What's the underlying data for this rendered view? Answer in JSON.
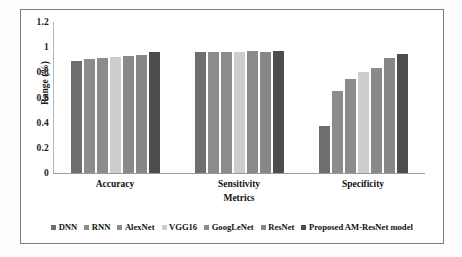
{
  "chart_data": {
    "type": "bar",
    "title": "",
    "xlabel": "Metrics",
    "ylabel": "Range (%)",
    "categories": [
      "Accuracy",
      "Sensitivity",
      "Specificity"
    ],
    "ylim": [
      0,
      1.2
    ],
    "yticks": [
      "0",
      "0.2",
      "0.4",
      "0.6",
      "0.8",
      "1",
      "1.2"
    ],
    "ytick_values": [
      0,
      0.2,
      0.4,
      0.6,
      0.8,
      1,
      1.2
    ],
    "grid": false,
    "legend_position": "bottom",
    "series": [
      {
        "name": "DNN",
        "color": "#6e6e6e",
        "values": [
          0.89,
          0.96,
          0.37
        ]
      },
      {
        "name": "RNN",
        "color": "#8c8c8c",
        "values": [
          0.91,
          0.965,
          0.65
        ]
      },
      {
        "name": "AlexNet",
        "color": "#8c8c8c",
        "values": [
          0.915,
          0.965,
          0.75
        ]
      },
      {
        "name": "VGG16",
        "color": "#cdcdcd",
        "values": [
          0.92,
          0.965,
          0.8
        ]
      },
      {
        "name": "GoogLeNet",
        "color": "#8a8a8a",
        "values": [
          0.93,
          0.97,
          0.835
        ]
      },
      {
        "name": "ResNet",
        "color": "#878787",
        "values": [
          0.94,
          0.965,
          0.915
        ]
      },
      {
        "name": "Proposed AM-ResNet model",
        "color": "#4d4d4d",
        "values": [
          0.96,
          0.97,
          0.945
        ]
      }
    ]
  },
  "legend": {
    "items": [
      {
        "label": "DNN"
      },
      {
        "label": "RNN"
      },
      {
        "label": "AlexNet"
      },
      {
        "label": "VGG16"
      },
      {
        "label": "GoogLeNet"
      },
      {
        "label": "ResNet"
      },
      {
        "label": "Proposed AM-ResNet model"
      }
    ]
  }
}
